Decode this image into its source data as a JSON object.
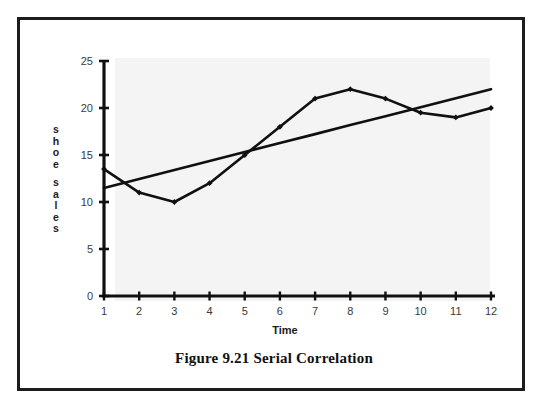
{
  "figure": {
    "caption": "Figure 9.21  Serial Correlation"
  },
  "axes": {
    "y_label_letters": [
      "s",
      "h",
      "o",
      "e",
      "s",
      "a",
      "l",
      "e",
      "s"
    ],
    "y_label_text": "shoe sales",
    "x_label_text": "Time",
    "y_ticks": [
      "0",
      "5",
      "10",
      "15",
      "20",
      "25"
    ],
    "x_ticks": [
      "1",
      "2",
      "3",
      "4",
      "5",
      "6",
      "7",
      "8",
      "9",
      "10",
      "11",
      "12"
    ]
  },
  "background_bleed": [
    {
      "text": "of the regression and the",
      "x": 150,
      "y": 72,
      "size": 12
    },
    {
      "text": "residuals plotted in figure 9.21",
      "x": 150,
      "y": 86,
      "size": 12
    },
    {
      "text": "statistic",
      "x": 290,
      "y": 140,
      "size": 12
    },
    {
      "text": "equation is as follows",
      "x": 165,
      "y": 176,
      "size": 12
    },
    {
      "text": "d =",
      "x": 300,
      "y": 204,
      "size": 13
    },
    {
      "text": "n",
      "x": 352,
      "y": 196,
      "size": 10
    },
    {
      "text": "t = 2",
      "x": 338,
      "y": 222,
      "size": 11
    },
    {
      "text": "is defined as",
      "x": 300,
      "y": 250,
      "size": 12
    }
  ],
  "colors": {
    "frame": "#1c1c1c",
    "plot_tint": "#f4f4f4",
    "line": "#101010",
    "axis": "#101010",
    "tick_label": "#3a3a3a",
    "bleed": "#c9cbcd"
  },
  "chart_data": {
    "type": "line",
    "title": "Figure 9.21  Serial Correlation",
    "xlabel": "Time",
    "ylabel": "shoe sales",
    "xlim": [
      1,
      12
    ],
    "ylim": [
      0,
      25
    ],
    "y_tick_values": [
      0,
      5,
      10,
      15,
      20,
      25
    ],
    "grid": false,
    "legend": "none",
    "x": [
      1,
      2,
      3,
      4,
      5,
      6,
      7,
      8,
      9,
      10,
      11,
      12
    ],
    "series": [
      {
        "name": "shoe sales",
        "style": "markers-line",
        "values": [
          13.5,
          11.0,
          10.0,
          12.0,
          15.0,
          18.0,
          21.0,
          22.0,
          21.0,
          19.5,
          19.0,
          20.0
        ]
      },
      {
        "name": "trend line",
        "style": "line",
        "values": [
          11.5,
          12.45,
          13.4,
          14.36,
          15.31,
          16.27,
          17.22,
          18.18,
          19.13,
          20.09,
          21.04,
          22.0
        ]
      }
    ]
  }
}
